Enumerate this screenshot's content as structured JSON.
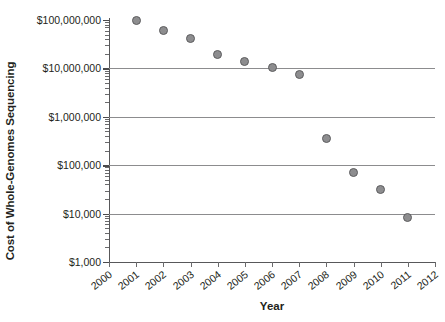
{
  "chart_data": {
    "type": "scatter",
    "title": "",
    "xlabel": "Year",
    "ylabel": "Cost of Whole-Genomes Sequencing",
    "yscale": "log",
    "ylim": [
      1000,
      100000000
    ],
    "xlim": [
      2000,
      2012
    ],
    "grid": true,
    "legend": null,
    "y_tick_labels": [
      "$100,000,000",
      "$10,000,000",
      "$1,000,000",
      "$100,000",
      "$10,000",
      "$1,000"
    ],
    "y_tick_values": [
      100000000,
      10000000,
      1000000,
      100000,
      10000,
      1000
    ],
    "x_tick_labels": [
      "2000",
      "2001",
      "2002",
      "2003",
      "2004",
      "2005",
      "2006",
      "2007",
      "2008",
      "2009",
      "2010",
      "2011",
      "2012"
    ],
    "x_tick_values": [
      2000,
      2001,
      2002,
      2003,
      2004,
      2005,
      2006,
      2007,
      2008,
      2009,
      2010,
      2011,
      2012
    ],
    "x": [
      2001,
      2002,
      2003,
      2004,
      2005,
      2006,
      2007,
      2008,
      2009,
      2010,
      2011
    ],
    "values": [
      100000000,
      62000000,
      41000000,
      19000000,
      14000000,
      10500000,
      7600000,
      360000,
      72000,
      31000,
      8500
    ],
    "marker_color": "#8d8d8f",
    "marker_edge_color": "#5d5d5f",
    "gridline_color": "#8c8c8e",
    "axis_color": "#58585a",
    "text_color": "#231f20"
  }
}
